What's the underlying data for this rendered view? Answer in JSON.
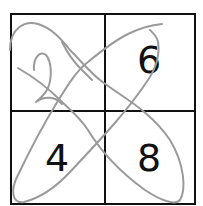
{
  "puzzle": {
    "cells": [
      {
        "position": "top-left",
        "value": "2",
        "style": "handwritten"
      },
      {
        "position": "top-right",
        "value": "6",
        "style": "printed"
      },
      {
        "position": "bottom-left",
        "value": "4",
        "style": "printed"
      },
      {
        "position": "bottom-right",
        "value": "8",
        "style": "printed"
      }
    ]
  },
  "colors": {
    "grid": "#111111",
    "pencil": "#9a9a9a",
    "background": "#ffffff"
  }
}
